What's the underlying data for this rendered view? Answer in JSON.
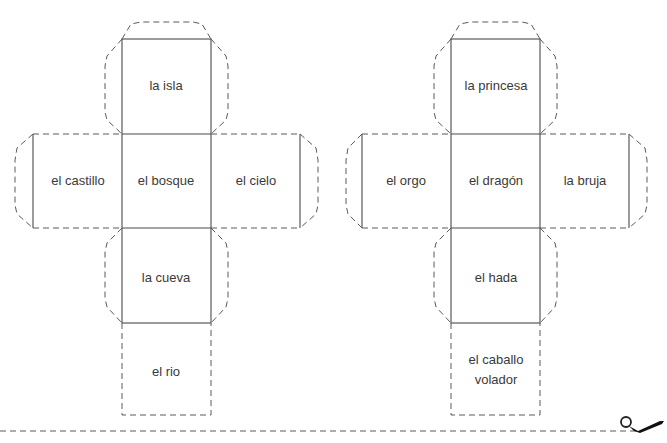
{
  "cube_nets": [
    {
      "name": "lugares",
      "faces": {
        "top": "la isla",
        "left": "el castillo",
        "center": "el bosque",
        "right": "el cielo",
        "bottom": "la cueva",
        "extra": "el rio"
      }
    },
    {
      "name": "personajes",
      "faces": {
        "top": "la princesa",
        "left": "el orgo",
        "center": "el dragón",
        "right": "la bruja",
        "bottom": "el hada",
        "extra_line1": "el caballo",
        "extra_line2": "volador"
      }
    }
  ],
  "cut_line": {
    "icon": "scissors-icon"
  }
}
